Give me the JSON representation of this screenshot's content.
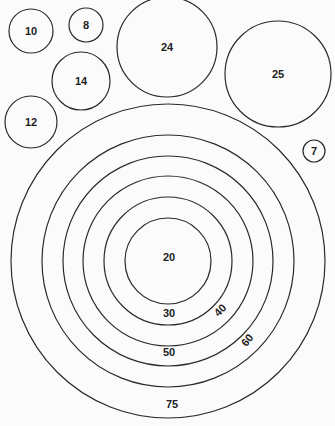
{
  "figure": {
    "background": "#fbfbfb",
    "stroke": "#2a2a2a",
    "separate_circles": [
      {
        "label": "10",
        "cx": 31,
        "cy": 31,
        "r": 22
      },
      {
        "label": "8",
        "cx": 86,
        "cy": 25,
        "r": 17
      },
      {
        "label": "24",
        "cx": 167,
        "cy": 47,
        "r": 50
      },
      {
        "label": "25",
        "cx": 278,
        "cy": 74,
        "r": 53
      },
      {
        "label": "14",
        "cx": 81,
        "cy": 81,
        "r": 29
      },
      {
        "label": "12",
        "cx": 31,
        "cy": 122,
        "r": 26
      },
      {
        "label": "7",
        "cx": 314,
        "cy": 151,
        "r": 11
      }
    ],
    "concentric": {
      "cx": 168,
      "cy": 261,
      "rings": [
        {
          "label": "20",
          "r": 43,
          "lx": 169,
          "ly": 257,
          "rot": 0
        },
        {
          "label": "30",
          "r": 64,
          "lx": 169,
          "ly": 313,
          "rot": 0
        },
        {
          "label": "40",
          "r": 85,
          "lx": 220,
          "ly": 310,
          "rot": -45
        },
        {
          "label": "50",
          "r": 105,
          "lx": 169,
          "ly": 352,
          "rot": 0
        },
        {
          "label": "60",
          "r": 126,
          "lx": 247,
          "ly": 340,
          "rot": -50
        },
        {
          "label": "75",
          "r": 157,
          "lx": 172,
          "ly": 404,
          "rot": 0
        }
      ]
    }
  }
}
